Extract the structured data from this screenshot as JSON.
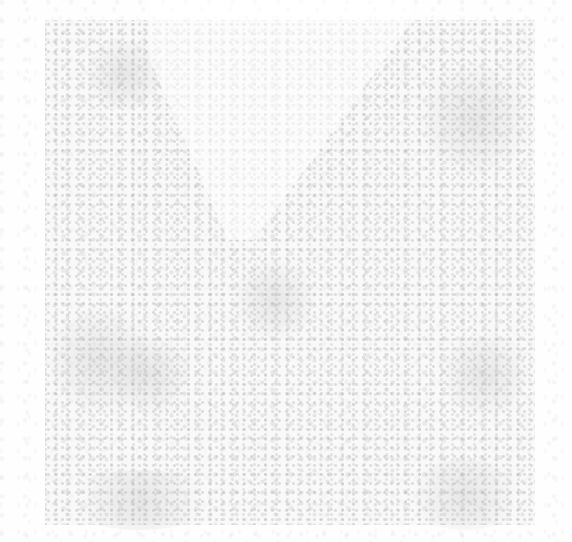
{
  "image": {
    "description": "faint grey noise texture on white background",
    "background_color": "#ffffff",
    "texture_color": "#b4b4b4",
    "regions": [
      {
        "name": "dense-speckle-square",
        "x": 45,
        "y": 20,
        "width": 490,
        "height": 505
      },
      {
        "name": "light-wedge",
        "x": 150,
        "y": 0,
        "width": 260,
        "height": 240
      }
    ]
  }
}
